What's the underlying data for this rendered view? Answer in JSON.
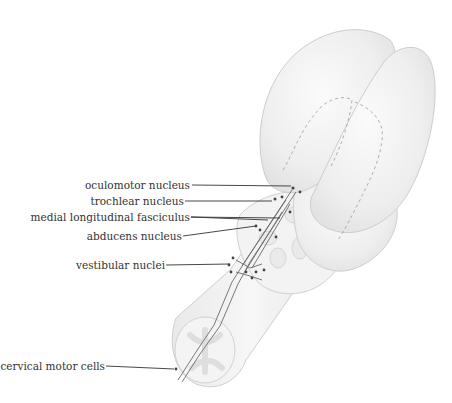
{
  "figure": {
    "colors": {
      "background": "#ffffff",
      "tissue_fill": "#f1f1f1",
      "tissue_edge": "#c9c9c9",
      "tract_line": "#6a6a6a",
      "leader_line": "#333333",
      "label_text": "#333333"
    }
  },
  "labels": [
    {
      "id": "oculomotor",
      "text": "oculomotor nucleus"
    },
    {
      "id": "trochlear",
      "text": "trochlear nucleus"
    },
    {
      "id": "mlf",
      "text": "medial longitudinal fasciculus"
    },
    {
      "id": "abducens",
      "text": "abducens nucleus"
    },
    {
      "id": "vestibular",
      "text": "vestibular nuclei"
    },
    {
      "id": "cervical",
      "text": "cervical motor cells"
    }
  ]
}
